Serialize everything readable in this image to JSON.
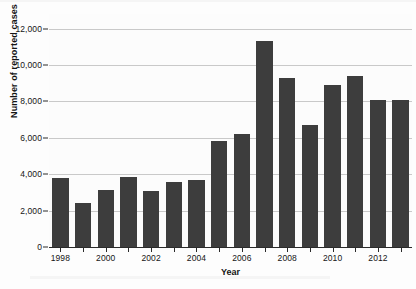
{
  "chart_data": {
    "type": "bar",
    "title": "",
    "xlabel": "Year",
    "ylabel": "Number of reported cases",
    "categories": [
      1998,
      1999,
      2000,
      2001,
      2002,
      2003,
      2004,
      2005,
      2006,
      2007,
      2008,
      2009,
      2010,
      2011,
      2012,
      2013
    ],
    "values": [
      3800,
      2400,
      3150,
      3850,
      3050,
      3550,
      3700,
      5800,
      6200,
      11300,
      9300,
      6700,
      8900,
      9400,
      8100,
      8050
    ],
    "ylim": [
      0,
      12800
    ],
    "yticks": [
      0,
      2000,
      4000,
      6000,
      8000,
      10000,
      12000
    ],
    "ytick_labels": [
      "0",
      "2,000",
      "4,000",
      "6,000",
      "8,000",
      "10,000",
      "12,000"
    ],
    "xtick_labels": [
      "1998",
      "2000",
      "2002",
      "2004",
      "2006",
      "2008",
      "2010",
      "2012"
    ],
    "xtick_values": [
      1998,
      2000,
      2002,
      2004,
      2006,
      2008,
      2010,
      2012
    ],
    "grid": "horizontal",
    "legend": "none",
    "bar_color": "#3d3d3d",
    "gridline_color": "#c9c9c9",
    "axis_color": "#2a2a2a",
    "background_color": "#fcfcfc"
  }
}
